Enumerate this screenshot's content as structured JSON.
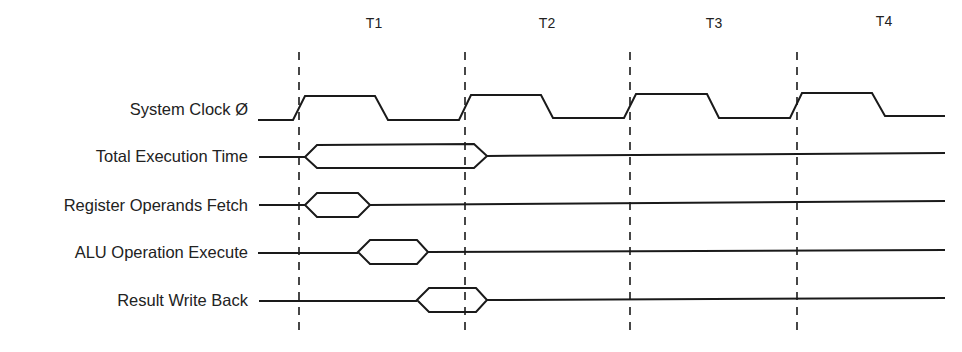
{
  "diagram": {
    "periods": [
      {
        "label": "T1",
        "x": 374
      },
      {
        "label": "T2",
        "x": 547
      },
      {
        "label": "T3",
        "x": 714
      },
      {
        "label": "T4",
        "x": 884
      }
    ],
    "boundaries_x": [
      299,
      465,
      630,
      797
    ],
    "signals": [
      {
        "label": "System Clock Ø",
        "y": 110,
        "type": "clock"
      },
      {
        "label": "Total Execution Time",
        "y": 153,
        "type": "bus",
        "start": 299,
        "end": 487
      },
      {
        "label": "Register Operands Fetch",
        "y": 205,
        "type": "bus",
        "start": 299,
        "end": 370
      },
      {
        "label": "ALU Operation Execute",
        "y": 252,
        "type": "bus",
        "start": 358,
        "end": 428
      },
      {
        "label": "Result Write Back",
        "y": 300,
        "type": "bus",
        "start": 417,
        "end": 487
      }
    ],
    "colors": {
      "line": "#1a1a1a",
      "text": "#222222",
      "background": "#ffffff"
    }
  }
}
